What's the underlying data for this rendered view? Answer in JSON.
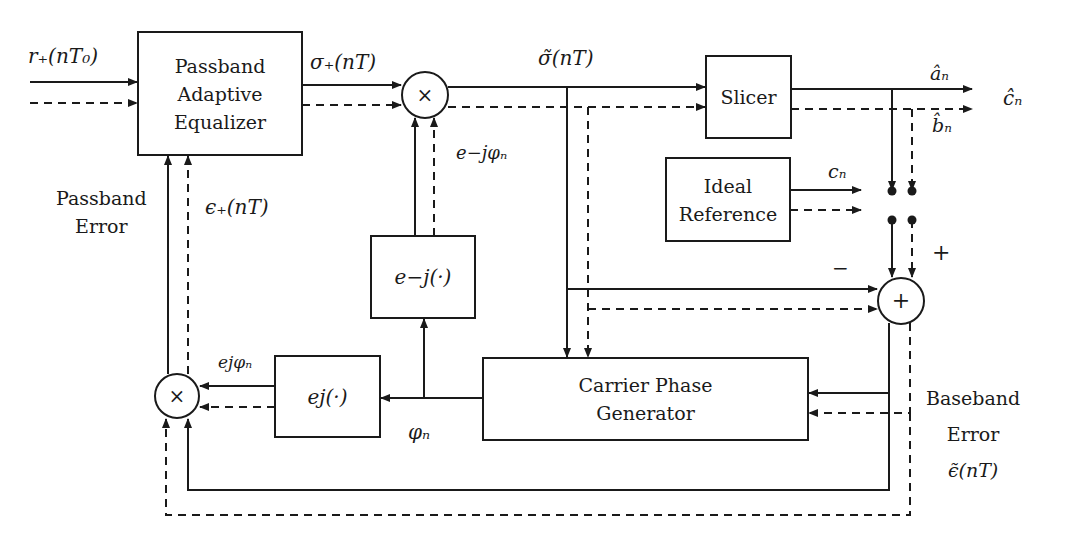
{
  "diagram": {
    "type": "block-diagram",
    "title": "",
    "blocks": {
      "equalizer": {
        "lines": [
          "Passband",
          "Adaptive",
          "Equalizer"
        ]
      },
      "slicer": {
        "lines": [
          "Slicer"
        ]
      },
      "ideal_reference": {
        "lines": [
          "Ideal",
          "Reference"
        ]
      },
      "exp_neg": {
        "label": "e−j(·)"
      },
      "exp_pos": {
        "label": "ej(·)"
      },
      "carrier_phase_generator": {
        "lines": [
          "Carrier Phase",
          "Generator"
        ]
      },
      "top_multiplier": {
        "symbol": "×"
      },
      "left_multiplier": {
        "symbol": "×"
      },
      "summer": {
        "symbol": "+"
      }
    },
    "signals": {
      "input": "r₊(nT₀)",
      "eq_output": "σ₊(nT)",
      "rotated": "σ̃(nT)",
      "a_hat": "âₙ",
      "c_hat": "ĉₙ",
      "b_hat": "b̂ₙ",
      "c_n": "cₙ",
      "neg_phase": "e−jφₙ",
      "pos_phase": "ejφₙ",
      "phi_n": "φₙ",
      "passband_error_label": [
        "Passband",
        "Error"
      ],
      "passband_error_symbol": "ϵ₊(nT)",
      "baseband_error_label": [
        "Baseband",
        "Error"
      ],
      "baseband_error_symbol": "ϵ̃(nT)",
      "minus_sign": "−",
      "plus_sign": "+"
    }
  }
}
